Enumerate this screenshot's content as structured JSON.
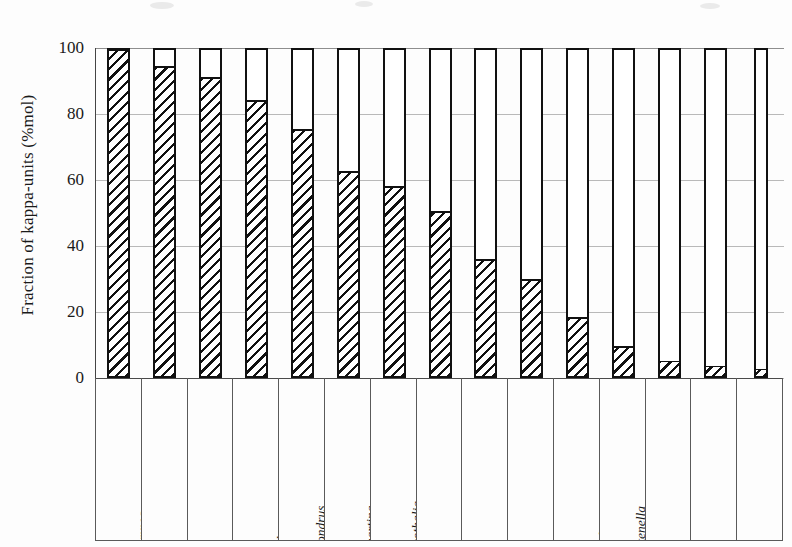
{
  "chart_data": {
    "type": "bar",
    "title": "",
    "xlabel": "",
    "ylabel": "Fraction of kappa-units (%mol)",
    "ylim": [
      0,
      100
    ],
    "yticks": [
      0,
      20,
      40,
      60,
      80,
      100
    ],
    "grid": true,
    "legend": "none",
    "note": "Stacked/outlined bars: hatched portion = fraction of kappa-units (%mol); each bar outline extends to 100.",
    "categories": [
      "Hypnea musciformis",
      "Kappaphycus alvarezii",
      "Kappaphycus alvarezii",
      "Eucheuma platycladum",
      "Chondrus crispus",
      "Gigartina skottsbergii",
      "Sarcothalia crispata",
      "Chondracanthus teedei",
      "Ahnfeltiopsis devoniensis",
      "Ahnfeltiopsis devoniensis",
      "Ahnfeltiopsis devoniensis",
      "Catenella impudica",
      "Eucheuma denticulatum",
      "Eucheuma denticulatum",
      "Agardhiella sp."
    ],
    "category_lines": [
      [
        "Hypnea",
        "musciformis"
      ],
      [
        "Kappaphycus",
        "alvarezii"
      ],
      [
        "Kappaphycus",
        "alvarezii"
      ],
      [
        "Eucheuma",
        "platycladum"
      ],
      [
        "Chondrus",
        "crispus"
      ],
      [
        "Gigartina",
        "skottsbergii"
      ],
      [
        "Sarcothalia",
        "crispata"
      ],
      [
        "Chondracanthus",
        "teedei"
      ],
      [
        "Ahnfeltiopsis",
        "devoniensis"
      ],
      [
        "Ahnfeltiopsis",
        "devoniensis"
      ],
      [
        "Ahnfeltiopsis",
        "devoniensis"
      ],
      [
        "Catenella",
        "impudica"
      ],
      [
        "Eucheuma",
        "denticulatum"
      ],
      [
        "Eucheuma",
        "denticulatum"
      ],
      [
        "Agardhiella sp."
      ]
    ],
    "values": [
      99,
      94,
      90.5,
      83.5,
      75,
      62,
      57.5,
      50,
      35.5,
      29.5,
      18,
      9,
      4.5,
      3,
      2
    ],
    "outline_values": [
      100,
      100,
      100,
      100,
      100,
      100,
      100,
      100,
      100,
      100,
      100,
      100,
      100,
      100,
      100
    ]
  },
  "style": {
    "hatch_color": "#111111",
    "bar_outline_color": "#111111",
    "grid_color": "#b9b9b9",
    "axis_color": "#4a4a4a",
    "background": "#fdfdfd"
  }
}
